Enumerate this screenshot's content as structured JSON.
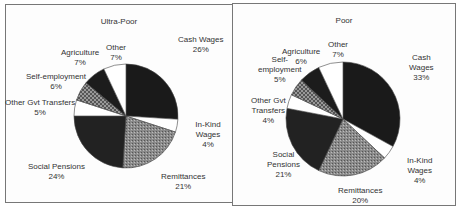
{
  "chart_data": [
    {
      "type": "pie",
      "title": "Ultra-Poor",
      "categories": [
        "Cash Wages",
        "In-Kind Wages",
        "Remittances",
        "Social Pensions",
        "Other Gvt Transfers",
        "Self-employment",
        "Agriculture",
        "Other"
      ],
      "values": [
        26,
        4,
        21,
        24,
        5,
        6,
        7,
        7
      ],
      "labels": [
        "Cash Wages\n26%",
        "In-Kind Wages\n4%",
        "Remittances\n21%",
        "Social Pensions\n24%",
        "Other Gvt Transfers\n5%",
        "Self-employment\n6%",
        "Agriculture\n7%",
        "Other\n7%"
      ]
    },
    {
      "type": "pie",
      "title": "Poor",
      "categories": [
        "Cash Wages",
        "In-Kind Wages",
        "Remittances",
        "Social Pensions",
        "Other Gvt Transfers",
        "Self-employment",
        "Agriculture",
        "Other"
      ],
      "values": [
        33,
        4,
        20,
        21,
        4,
        5,
        6,
        7
      ],
      "labels": [
        "Cash\nWages\n33%",
        "In-Kind\nWages\n4%",
        "Remittances\n20%",
        "Social\nPensions\n21%",
        "Other Gvt\nTransfers\n4%",
        "Self-\nemployment\n5%",
        "Agriculture\n6%",
        "Other\n7%"
      ]
    }
  ],
  "slice_fills": [
    "#1a1a1a",
    "#ffffff",
    "url(#dots)",
    "#222222",
    "#ffffff",
    "url(#check)",
    "#1c1c1c",
    "#ffffff"
  ]
}
